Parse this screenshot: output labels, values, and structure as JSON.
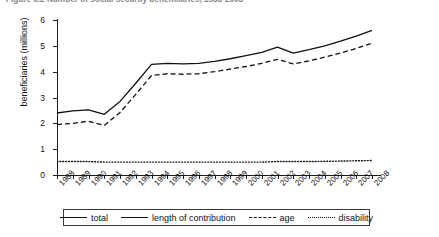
{
  "figure": {
    "title": "Figure 3.2   Number of social security beneficiaries, 1988-2008",
    "title_clipped": true
  },
  "axes": {
    "y_title": "beneficiaries (millions)",
    "y_ticks": [
      0,
      1,
      2,
      3,
      4,
      5,
      6
    ],
    "y_tick_labels": [
      "0",
      "1",
      "2",
      "3",
      "4",
      "5",
      "6"
    ],
    "x_tick_labels": [
      "1988",
      "1989",
      "1990",
      "1991",
      "1992",
      "1993",
      "1994",
      "1995",
      "1996",
      "1997",
      "1998",
      "1999",
      "2000",
      "2001",
      "2002",
      "2003",
      "2004",
      "2005",
      "2006",
      "2007",
      "2008"
    ]
  },
  "legend": {
    "items": [
      {
        "label": "total",
        "style": "solid",
        "icon": "line-solid-icon"
      },
      {
        "label": "length of contribution",
        "style": "solid",
        "icon": "line-solid-icon"
      },
      {
        "label": "age",
        "style": "dashed",
        "icon": "line-dashed-icon"
      },
      {
        "label": "disability",
        "style": "dotted",
        "icon": "line-dotted-icon"
      }
    ]
  },
  "colors": {
    "line": "#111111",
    "axis": "#1b1b1b",
    "background": "#ffffff"
  },
  "chart_data": {
    "type": "line",
    "title": "Figure 3.2   Number of social security beneficiaries, 1988-2008",
    "xlabel": "",
    "ylabel": "beneficiaries (millions)",
    "ylim": [
      0,
      6
    ],
    "grid": false,
    "legend_position": "bottom",
    "categories": [
      "1988",
      "1989",
      "1990",
      "1991",
      "1992",
      "1993",
      "1994",
      "1995",
      "1996",
      "1997",
      "1998",
      "1999",
      "2000",
      "2001",
      "2002",
      "2003",
      "2004",
      "2005",
      "2006",
      "2007",
      "2008"
    ],
    "series": [
      {
        "name": "total",
        "style": "solid",
        "values": [
          2.4,
          2.48,
          2.52,
          2.35,
          2.85,
          3.55,
          4.28,
          4.32,
          4.3,
          4.32,
          4.4,
          4.5,
          4.62,
          4.75,
          4.95,
          4.72,
          4.85,
          5.0,
          5.18,
          5.38,
          5.6
        ]
      },
      {
        "name": "length of contribution",
        "style": "solid",
        "values": [
          2.4,
          2.48,
          2.52,
          2.35,
          2.85,
          3.55,
          4.28,
          4.32,
          4.3,
          4.32,
          4.4,
          4.5,
          4.62,
          4.75,
          4.95,
          4.72,
          4.85,
          5.0,
          5.18,
          5.38,
          5.6
        ]
      },
      {
        "name": "age",
        "style": "dashed",
        "values": [
          1.95,
          2.0,
          2.08,
          1.92,
          2.42,
          3.12,
          3.85,
          3.92,
          3.9,
          3.92,
          4.0,
          4.1,
          4.2,
          4.32,
          4.48,
          4.3,
          4.42,
          4.56,
          4.72,
          4.9,
          5.1
        ]
      },
      {
        "name": "disability",
        "style": "dotted",
        "values": [
          0.52,
          0.52,
          0.52,
          0.5,
          0.5,
          0.5,
          0.5,
          0.5,
          0.5,
          0.5,
          0.5,
          0.5,
          0.5,
          0.5,
          0.52,
          0.52,
          0.52,
          0.53,
          0.54,
          0.55,
          0.56
        ]
      }
    ]
  }
}
